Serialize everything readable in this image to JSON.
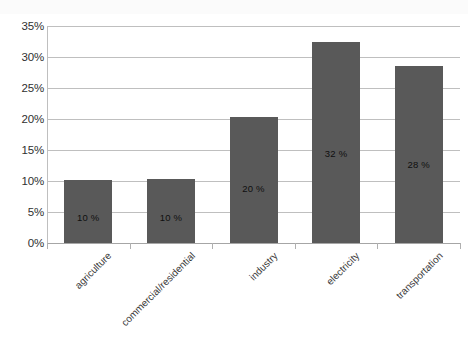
{
  "chart_data": {
    "type": "bar",
    "title": "",
    "subtitle": "",
    "xlabel": "",
    "ylabel": "",
    "categories": [
      "agriculture",
      "commercial/residential",
      "industry",
      "electricity",
      "transportation"
    ],
    "values": [
      10.2,
      10.3,
      20.4,
      32.4,
      28.6
    ],
    "data_labels": [
      "10 %",
      "10 %",
      "20 %",
      "32 %",
      "28 %"
    ],
    "series": [
      {
        "name": "share",
        "values": [
          10.2,
          10.3,
          20.4,
          32.4,
          28.6
        ]
      }
    ],
    "ylim": [
      0,
      35
    ],
    "y_ticks": [
      0,
      5,
      10,
      15,
      20,
      25,
      30,
      35
    ],
    "y_tick_labels": [
      "0%",
      "5%",
      "10%",
      "15%",
      "20%",
      "25%",
      "30%",
      "35%"
    ],
    "grid": true,
    "legend": false,
    "legend_position": "none",
    "bar_color": "#595959",
    "gridline_color": "#bfbfbf",
    "label_color": "#0f0f0f",
    "background_color": "#ffffff"
  }
}
